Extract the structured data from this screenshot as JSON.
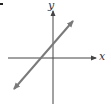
{
  "figure": {
    "marker": ".",
    "axes": {
      "x_label": "x",
      "y_label": "y",
      "x_axis_color": "#444444",
      "y_axis_color": "#444444"
    },
    "line": {
      "description": "straight line with positive slope, arrows on both ends, positive y-intercept, negative x-intercept",
      "color": "#7a7a7a",
      "slope_sign": "positive",
      "y_intercept_sign": "positive",
      "x_intercept_sign": "negative"
    }
  }
}
